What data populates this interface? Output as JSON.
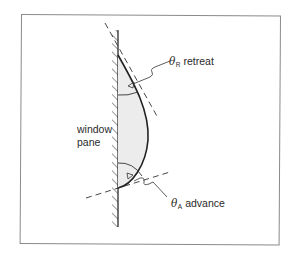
{
  "diagram": {
    "title": "",
    "labels": {
      "wall_line1": "window",
      "wall_line2": "pane",
      "retreat": {
        "symbol": "θ",
        "subscript": "R",
        "text": "retreat"
      },
      "advance": {
        "symbol": "θ",
        "subscript": "A",
        "text": "advance"
      }
    },
    "colors": {
      "line": "#2a2a2a",
      "drop_fill": "#ececec",
      "frame": "#8a8a8a"
    }
  }
}
